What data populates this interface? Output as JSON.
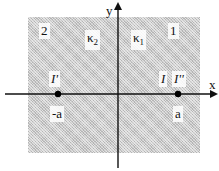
{
  "diagram": {
    "axes": {
      "x_label": "x",
      "y_label": "y"
    },
    "regions": [
      {
        "id": "region-2",
        "label": "2"
      },
      {
        "id": "region-1",
        "label": "1"
      }
    ],
    "media": [
      {
        "symbol": "κ",
        "subscript": "2"
      },
      {
        "symbol": "κ",
        "subscript": "1"
      }
    ],
    "points": [
      {
        "label": "I'",
        "position_label": "-a"
      },
      {
        "label": "I",
        "position_label": ""
      },
      {
        "label": "I''",
        "position_label": "a"
      }
    ],
    "colors": {
      "region_fill": "#c9c9c9",
      "axis": "#111111",
      "point": "#000000"
    }
  }
}
